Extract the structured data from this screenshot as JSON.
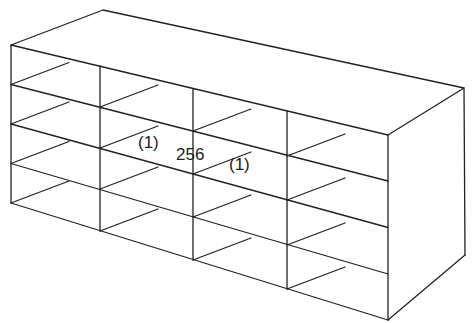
{
  "diagram": {
    "type": "isometric-rack",
    "columns": 4,
    "rows": 4,
    "line_color": "#222222",
    "labels": [
      {
        "id": "left-count",
        "text": "(1)",
        "x": 138,
        "y": 134
      },
      {
        "id": "capacity",
        "text": "256",
        "x": 176,
        "y": 146
      },
      {
        "id": "right-count",
        "text": "(1)",
        "x": 229,
        "y": 156
      }
    ]
  }
}
